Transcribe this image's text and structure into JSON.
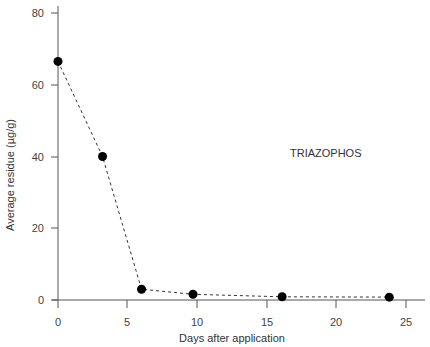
{
  "chart_data": {
    "type": "line",
    "title": "",
    "annotation": "TRIAZOPHOS",
    "xlabel": "Days after application",
    "ylabel": "Average residue (µg/g)",
    "xlim": [
      0,
      27
    ],
    "ylim": [
      0,
      80
    ],
    "xticks": [
      0,
      5,
      10,
      15,
      20,
      25
    ],
    "yticks": [
      0,
      20,
      40,
      60,
      80
    ],
    "grid": false,
    "legend": null,
    "series": [
      {
        "name": "TRIAZOPHOS",
        "line_style": "dashed",
        "marker": "filled-circle",
        "x": [
          0,
          3.2,
          6,
          9.7,
          16.1,
          23.8
        ],
        "y": [
          66.5,
          40,
          3,
          1.6,
          0.9,
          0.8
        ]
      }
    ]
  },
  "labels": {
    "annotation": "TRIAZOPHOS",
    "xlabel": "Days after application",
    "ylabel": "Average residue (µg/g)",
    "xtick_labels": [
      "0",
      "5",
      "10",
      "15",
      "20",
      "25"
    ],
    "ytick_labels": [
      "0",
      "20",
      "40",
      "60",
      "80"
    ]
  }
}
